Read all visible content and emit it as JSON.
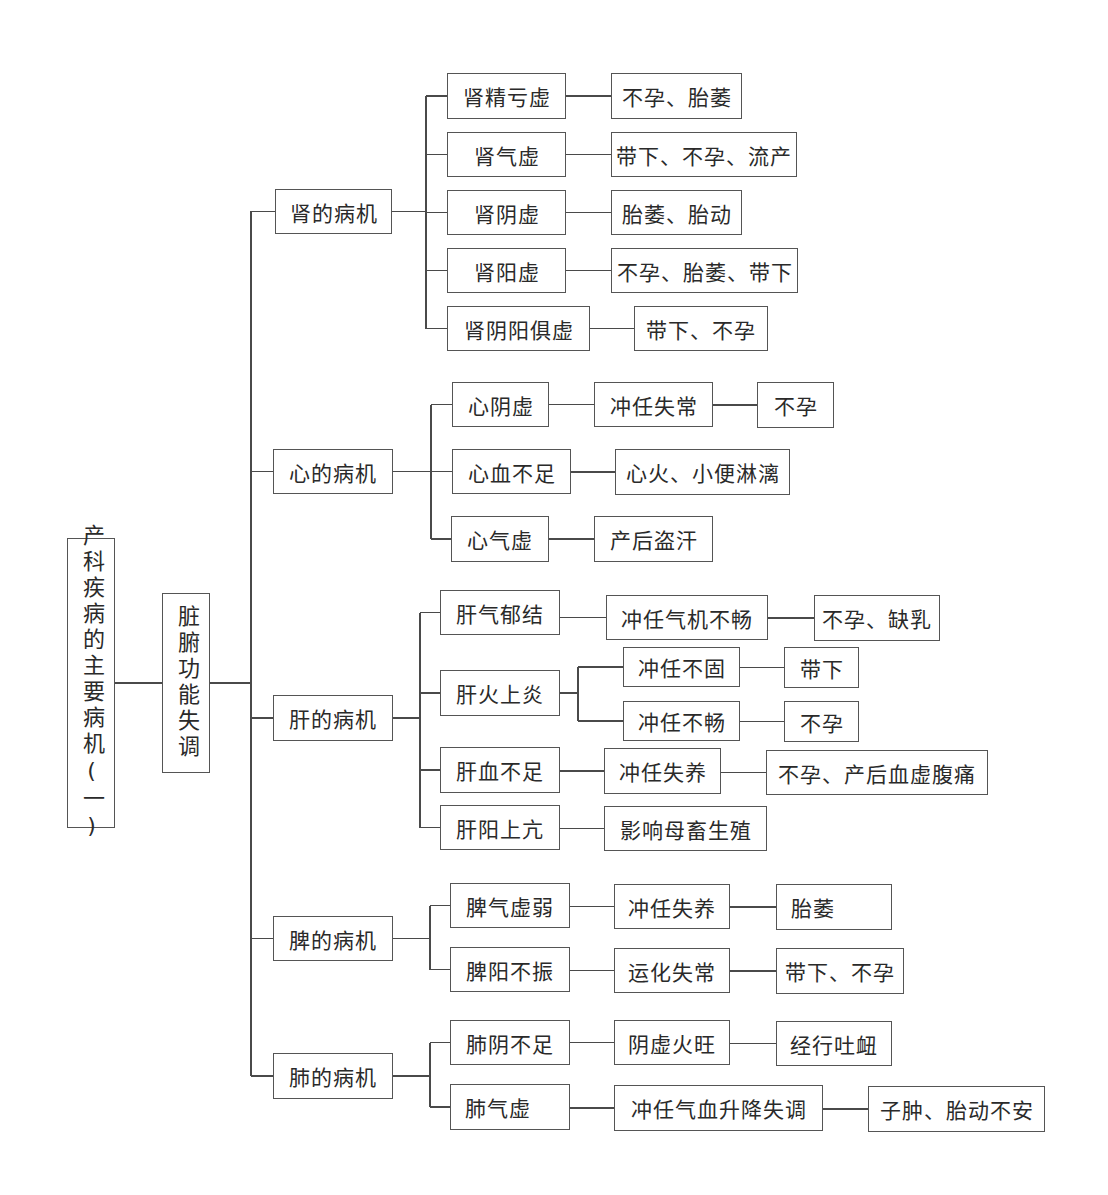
{
  "diagram": {
    "title": "产科疾病的主要病机(一)",
    "line_color": "#4a4a4a",
    "root": {
      "label": "产科疾病的主要病机(一)",
      "box": [
        67,
        538,
        48,
        290
      ]
    },
    "level1": {
      "label": "脏腑功能失调",
      "box": [
        162,
        593,
        48,
        180
      ]
    },
    "trunk": {
      "x": 251,
      "y_top": 211,
      "y_bottom": 1076,
      "join_y": 683
    },
    "organs": [
      {
        "label": "肾的病机",
        "box": [
          275,
          189,
          117,
          45
        ],
        "fork_x": 426,
        "children": [
          {
            "label": "肾精亏虚",
            "box": [
              447,
              73,
              119,
              46
            ],
            "chain": [
              {
                "label": "不孕、胎萎",
                "box": [
                  611,
                  73,
                  131,
                  46
                ]
              }
            ]
          },
          {
            "label": "肾气虚",
            "box": [
              447,
              132,
              119,
              45
            ],
            "chain": [
              {
                "label": "带下、不孕、流产",
                "box": [
                  611,
                  132,
                  186,
                  45
                ]
              }
            ]
          },
          {
            "label": "肾阴虚",
            "box": [
              447,
              190,
              119,
              45
            ],
            "chain": [
              {
                "label": "胎萎、胎动",
                "box": [
                  611,
                  190,
                  131,
                  45
                ]
              }
            ]
          },
          {
            "label": "肾阳虚",
            "box": [
              447,
              248,
              119,
              45
            ],
            "chain": [
              {
                "label": "不孕、胎萎、带下",
                "box": [
                  611,
                  248,
                  187,
                  45
                ]
              }
            ]
          },
          {
            "label": "肾阴阳俱虚",
            "box": [
              447,
              306,
              143,
              45
            ],
            "chain": [
              {
                "label": "带下、不孕",
                "box": [
                  634,
                  306,
                  134,
                  45
                ]
              }
            ]
          }
        ]
      },
      {
        "label": "心的病机",
        "box": [
          273,
          449,
          120,
          45
        ],
        "fork_x": 431,
        "children": [
          {
            "label": "心阴虚",
            "box": [
              452,
              382,
              97,
              45
            ],
            "chain": [
              {
                "label": "冲任失常",
                "box": [
                  594,
                  382,
                  119,
                  45
                ]
              },
              {
                "label": "不孕",
                "box": [
                  757,
                  382,
                  77,
                  46
                ]
              }
            ]
          },
          {
            "label": "心血不足",
            "box": [
              452,
              449,
              119,
              45
            ],
            "chain": [
              {
                "label": "心火、小便淋漓",
                "box": [
                  615,
                  449,
                  175,
                  46
                ]
              }
            ]
          },
          {
            "label": "心气虚",
            "box": [
              451,
              516,
              98,
              46
            ],
            "chain": [
              {
                "label": "产后盗汗",
                "box": [
                  594,
                  516,
                  119,
                  46
                ]
              }
            ]
          }
        ]
      },
      {
        "label": "肝的病机",
        "box": [
          273,
          695,
          120,
          46
        ],
        "fork_x": 420,
        "children": [
          {
            "label": "肝气郁结",
            "box": [
              440,
              590,
              120,
              45
            ],
            "chain": [
              {
                "label": "冲任气机不畅",
                "box": [
                  606,
                  595,
                  162,
                  45
                ]
              },
              {
                "label": "不孕、缺乳",
                "box": [
                  814,
                  595,
                  126,
                  46
                ]
              }
            ]
          },
          {
            "label": "肝火上炎",
            "box": [
              440,
              670,
              120,
              46
            ],
            "subfork_x": 578,
            "branches": [
              {
                "label": "冲任不固",
                "box": [
                  623,
                  647,
                  117,
                  40
                ],
                "chain": [
                  {
                    "label": "带下",
                    "box": [
                      784,
                      647,
                      75,
                      41
                    ]
                  }
                ]
              },
              {
                "label": "冲任不畅",
                "box": [
                  623,
                  701,
                  117,
                  40
                ],
                "chain": [
                  {
                    "label": "不孕",
                    "box": [
                      784,
                      701,
                      75,
                      41
                    ]
                  }
                ]
              }
            ]
          },
          {
            "label": "肝血不足",
            "box": [
              440,
              747,
              120,
              46
            ],
            "chain": [
              {
                "label": "冲任失养",
                "box": [
                  604,
                  748,
                  117,
                  46
                ]
              },
              {
                "label": "不孕、产后血虚腹痛",
                "box": [
                  766,
                  750,
                  222,
                  45
                ]
              }
            ]
          },
          {
            "label": "肝阳上亢",
            "box": [
              440,
              805,
              120,
              45
            ],
            "chain": [
              {
                "label": "影响母畜生殖",
                "box": [
                  604,
                  806,
                  163,
                  45
                ]
              }
            ]
          }
        ]
      },
      {
        "label": "脾的病机",
        "box": [
          273,
          916,
          120,
          45
        ],
        "fork_x": 430,
        "children": [
          {
            "label": "脾气虚弱",
            "box": [
              450,
              883,
              120,
              45
            ],
            "chain": [
              {
                "label": "冲任失养",
                "box": [
                  614,
                  884,
                  116,
                  45
                ]
              },
              {
                "label": "胎萎",
                "box": [
                  776,
                  884,
                  116,
                  46
                ],
                "align": "left"
              }
            ]
          },
          {
            "label": "脾阳不振",
            "box": [
              450,
              947,
              120,
              45
            ],
            "chain": [
              {
                "label": "运化失常",
                "box": [
                  614,
                  948,
                  116,
                  45
                ]
              },
              {
                "label": "带下、不孕",
                "box": [
                  776,
                  948,
                  128,
                  46
                ]
              }
            ]
          }
        ]
      },
      {
        "label": "肺的病机",
        "box": [
          273,
          1053,
          120,
          46
        ],
        "fork_x": 430,
        "children": [
          {
            "label": "肺阴不足",
            "box": [
              450,
              1020,
              120,
              45
            ],
            "chain": [
              {
                "label": "阴虚火旺",
                "box": [
                  614,
                  1020,
                  116,
                  45
                ]
              },
              {
                "label": "经行吐衄",
                "box": [
                  776,
                  1021,
                  116,
                  45
                ]
              }
            ]
          },
          {
            "label": "肺气虚",
            "box": [
              450,
              1084,
              120,
              46
            ],
            "align": "left",
            "chain": [
              {
                "label": "冲任气血升降失调",
                "box": [
                  614,
                  1085,
                  209,
                  46
                ]
              },
              {
                "label": "子肿、胎动不安",
                "box": [
                  868,
                  1086,
                  177,
                  46
                ]
              }
            ]
          }
        ]
      }
    ]
  }
}
